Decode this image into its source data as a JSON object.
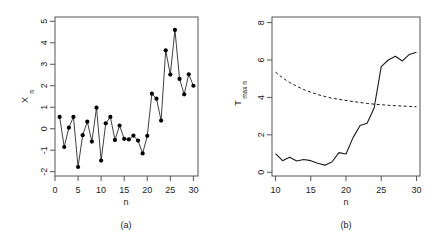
{
  "figure": {
    "background": "#ffffff",
    "line_color": "#1a1a1a",
    "point_color": "#000000"
  },
  "panels": [
    {
      "id": "a",
      "caption": "(a)",
      "xlabel": "n",
      "ylabel_main": "X",
      "ylabel_sub": "n",
      "xticks": [
        "0",
        "5",
        "10",
        "15",
        "20",
        "25",
        "30"
      ],
      "yticks": [
        "-2",
        "-1",
        "0",
        "1",
        "2",
        "3",
        "4",
        "5"
      ]
    },
    {
      "id": "b",
      "caption": "(b)",
      "xlabel": "n",
      "ylabel_main": "T",
      "ylabel_sub": "max n",
      "xticks": [
        "10",
        "15",
        "20",
        "25",
        "30"
      ],
      "yticks": [
        "0",
        "2",
        "4",
        "6",
        "8"
      ]
    }
  ],
  "chart_data": [
    {
      "type": "scatter",
      "title": "",
      "panel": "(a)",
      "xlabel": "n",
      "ylabel": "X_n",
      "xlim": [
        0,
        31
      ],
      "ylim": [
        -2.2,
        5.2
      ],
      "xticks": [
        0,
        5,
        10,
        15,
        20,
        25,
        30
      ],
      "yticks": [
        -2,
        -1,
        0,
        1,
        2,
        3,
        4,
        5
      ],
      "grid": false,
      "legend": "none",
      "markers": "filled-circle",
      "connected": true,
      "x": [
        1,
        2,
        3,
        4,
        5,
        6,
        7,
        8,
        9,
        10,
        11,
        12,
        13,
        14,
        15,
        16,
        17,
        18,
        19,
        20,
        21,
        22,
        23,
        24,
        25,
        26,
        27,
        28,
        29,
        30
      ],
      "values": [
        0.55,
        -0.85,
        0.05,
        0.55,
        -1.78,
        -0.3,
        0.33,
        -0.6,
        0.98,
        -1.48,
        0.25,
        0.55,
        -0.52,
        0.15,
        -0.47,
        -0.5,
        -0.32,
        -0.55,
        -1.15,
        -0.33,
        1.63,
        1.4,
        0.38,
        3.65,
        2.52,
        4.6,
        2.32,
        1.6,
        2.53,
        2.0
      ]
    },
    {
      "type": "line",
      "title": "",
      "panel": "(b)",
      "xlabel": "n",
      "ylabel": "T_max n",
      "xlim": [
        9.5,
        30.5
      ],
      "ylim": [
        -0.2,
        8.3
      ],
      "xticks": [
        10,
        15,
        20,
        25,
        30
      ],
      "yticks": [
        0,
        2,
        4,
        6,
        8
      ],
      "grid": false,
      "legend": "none",
      "x": [
        10,
        11,
        12,
        13,
        14,
        15,
        16,
        17,
        18,
        19,
        20,
        21,
        22,
        23,
        24,
        25,
        26,
        27,
        28,
        29,
        30
      ],
      "series": [
        {
          "name": "observed",
          "style": "solid",
          "values": [
            1.0,
            0.62,
            0.8,
            0.6,
            0.68,
            0.62,
            0.48,
            0.38,
            0.55,
            1.05,
            0.98,
            1.85,
            2.5,
            2.62,
            3.45,
            5.65,
            6.0,
            6.2,
            5.95,
            6.3,
            6.42
          ]
        },
        {
          "name": "threshold",
          "style": "dashed",
          "values": [
            5.35,
            5.05,
            4.8,
            4.6,
            4.42,
            4.28,
            4.15,
            4.05,
            3.96,
            3.9,
            3.84,
            3.78,
            3.73,
            3.68,
            3.64,
            3.61,
            3.58,
            3.56,
            3.54,
            3.52,
            3.5
          ]
        }
      ]
    }
  ]
}
